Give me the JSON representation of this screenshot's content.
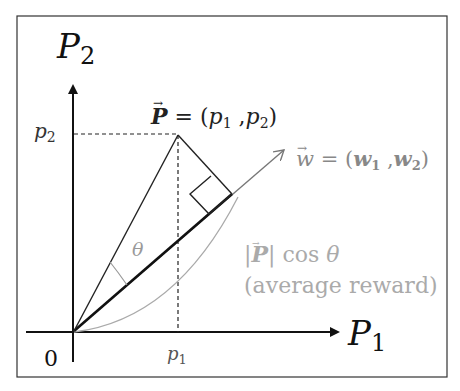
{
  "diagram": {
    "axes": {
      "y_label": "P",
      "y_sub": "2",
      "x_label": "P",
      "x_sub": "1",
      "origin_label": "0"
    },
    "ticks": {
      "p2_label": "p",
      "p2_sub": "2",
      "p1_label": "p",
      "p1_sub": "1"
    },
    "vector_P": {
      "name": "P",
      "eq": " = (",
      "c1": "p",
      "c1_sub": "1",
      "sep": " ,",
      "c2": "p",
      "c2_sub": "2",
      "close": ")"
    },
    "vector_w": {
      "name": "w",
      "eq": " = (",
      "c1": "w",
      "c1_sub": "1",
      "sep": " ,",
      "c2": "w",
      "c2_sub": "2",
      "close": ")"
    },
    "angle_label": "θ",
    "projection": {
      "bar_open": "|",
      "vec": "P",
      "bar_close": "|",
      "cos": " cos ",
      "theta": "θ",
      "caption": "(average reward)"
    },
    "colors": {
      "primary": "#111111",
      "secondary": "#999999",
      "frame": "#333333"
    }
  }
}
